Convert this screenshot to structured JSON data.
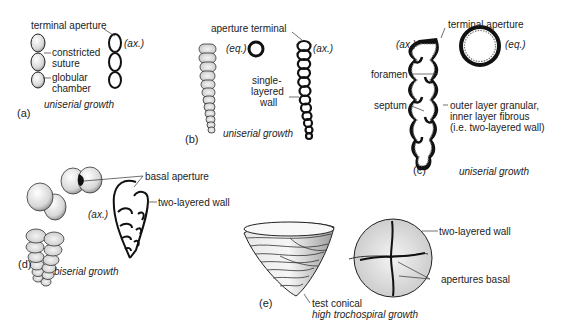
{
  "figure": {
    "panels": [
      {
        "id": "a",
        "panel_label": "(a)",
        "growth": "uniserial growth",
        "section_label": "(ax.)",
        "labels": {
          "terminal_aperture": "terminal aperture",
          "constricted": "constricted",
          "suture": "suture",
          "globular": "globular",
          "chamber": "chamber"
        }
      },
      {
        "id": "b",
        "panel_label": "(b)",
        "growth": "uniserial growth",
        "equatorial_label": "(eq.)",
        "section_label": "(ax.)",
        "labels": {
          "aperture_terminal": "aperture terminal",
          "single": "single-",
          "layered": "layered",
          "wall": "wall"
        }
      },
      {
        "id": "c",
        "panel_label": "(c)",
        "growth": "uniserial growth",
        "section_label": "(ax.)",
        "equatorial_label": "(eq.)",
        "labels": {
          "terminal_aperture": "terminal aperture",
          "foramen": "foramen",
          "septum": "septum",
          "wall_line1": "outer layer granular,",
          "wall_line2": "inner layer fibrous",
          "wall_line3": "(i.e. two-layered wall)"
        }
      },
      {
        "id": "d",
        "panel_label": "(d)",
        "growth": "biserial growth",
        "section_label": "(ax.)",
        "labels": {
          "basal_aperture": "basal aperture",
          "two_layered_wall": "two-layered wall"
        }
      },
      {
        "id": "e",
        "panel_label": "(e)",
        "growth": "high trochospiral growth",
        "labels": {
          "test_conical": "test conical",
          "two_layered_wall": "two-layered wall",
          "apertures_basal": "apertures basal"
        }
      }
    ]
  }
}
